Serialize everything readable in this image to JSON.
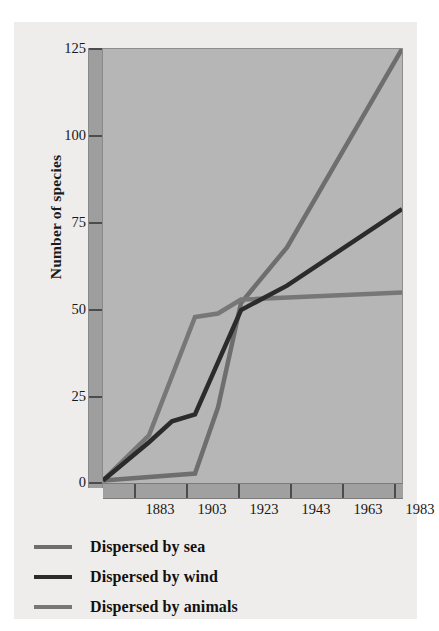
{
  "chart_data": {
    "type": "line",
    "title": "",
    "xlabel": "",
    "ylabel": "Number of species",
    "xlim": [
      1863,
      1993
    ],
    "ylim": [
      0,
      125
    ],
    "grid": false,
    "legend_position": "below",
    "x_ticks": [
      "1883",
      "1903",
      "1923",
      "1943",
      "1963",
      "1983"
    ],
    "y_ticks": [
      "0",
      "25",
      "50",
      "75",
      "100",
      "125"
    ],
    "x": [
      1863,
      1883,
      1893,
      1903,
      1913,
      1923,
      1943,
      1993
    ],
    "series": [
      {
        "name": "Dispersed by sea",
        "color": "#6e6e6e",
        "x": [
          1863,
          1903,
          1913,
          1923,
          1943,
          1993
        ],
        "values": [
          1,
          3,
          22,
          52,
          68,
          125
        ]
      },
      {
        "name": "Dispersed by wind",
        "color": "#2b2b2b",
        "x": [
          1863,
          1883,
          1893,
          1903,
          1923,
          1943,
          1993
        ],
        "values": [
          1,
          12,
          18,
          20,
          50,
          57,
          79
        ]
      },
      {
        "name": "Dispersed by animals",
        "color": "#777777",
        "x": [
          1863,
          1883,
          1903,
          1913,
          1923,
          1993
        ],
        "values": [
          1,
          14,
          48,
          49,
          53,
          55
        ]
      }
    ]
  },
  "axes": {
    "ylabel": "Number of species",
    "y_ticks": [
      {
        "label": "125",
        "value": 125
      },
      {
        "label": "100",
        "value": 100
      },
      {
        "label": "75",
        "value": 75
      },
      {
        "label": "50",
        "value": 50
      },
      {
        "label": "25",
        "value": 25
      },
      {
        "label": "0",
        "value": 0
      }
    ],
    "x_ticks": [
      {
        "label": "1883",
        "value": 1883
      },
      {
        "label": "1903",
        "value": 1903
      },
      {
        "label": "1923",
        "value": 1923
      },
      {
        "label": "1943",
        "value": 1943
      },
      {
        "label": "1963",
        "value": 1963
      },
      {
        "label": "1983",
        "value": 1983
      }
    ]
  },
  "legend": {
    "items": [
      {
        "label": "Dispersed by sea",
        "color": "#6e6e6e"
      },
      {
        "label": "Dispersed by wind",
        "color": "#2b2b2b"
      },
      {
        "label": "Dispersed by animals",
        "color": "#777777"
      }
    ]
  },
  "colors": {
    "page_background": "#ffffff",
    "figure_background": "#eeedeb",
    "plot_background": "#b6b6b6",
    "axis_band": "#9e9e9e",
    "tick_mark": "#4c4c4c",
    "text": "#171717"
  }
}
